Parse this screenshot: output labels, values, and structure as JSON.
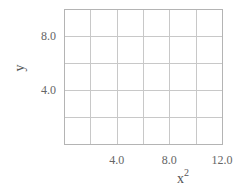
{
  "chart_data": {
    "type": "line",
    "title": "",
    "xlabel": "x",
    "xlabel_superscript": "2",
    "ylabel": "y",
    "xlim": [
      0,
      12
    ],
    "ylim": [
      0,
      10
    ],
    "x_ticks": [
      4.0,
      8.0,
      12.0
    ],
    "x_tick_labels": [
      "4.0",
      "8.0",
      "12.0"
    ],
    "y_ticks": [
      4.0,
      8.0
    ],
    "y_tick_labels": [
      "4.0",
      "8.0"
    ],
    "x_gridlines": [
      2,
      4,
      6,
      8,
      10
    ],
    "y_gridlines": [
      2,
      4,
      6,
      8
    ],
    "grid": true,
    "series": []
  },
  "style": {
    "grid_color": "#c8c8c8",
    "frame_color": "#b4b4b4",
    "text_color": "#666666"
  }
}
